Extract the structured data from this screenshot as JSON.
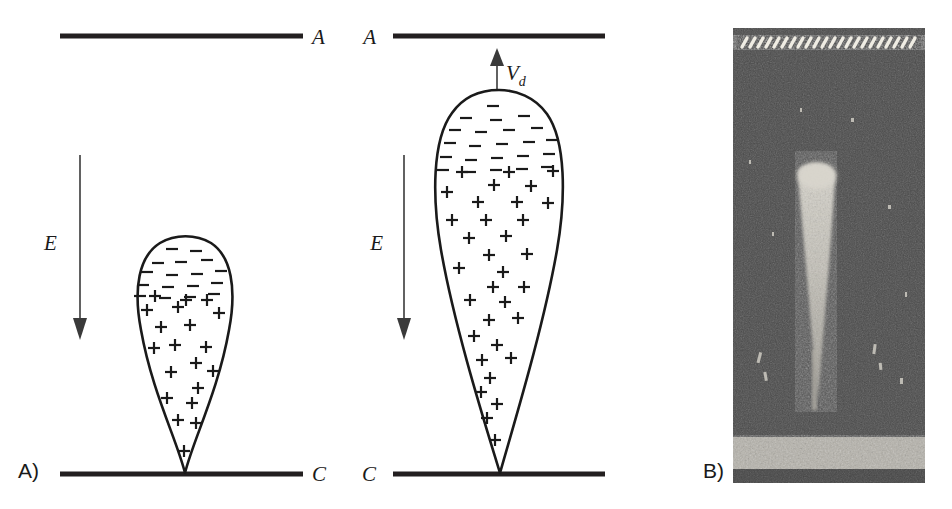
{
  "figure": {
    "background_color": "#ffffff",
    "ink_color": "#1a1a1a",
    "width": 952,
    "height": 509
  },
  "panels": [
    {
      "id": "panel-a",
      "tag": "A)",
      "tag_x": 18,
      "tag_y": 478,
      "description": "Schematic of a small charged droplet on the cathode between two plane electrodes",
      "anode": {
        "label": "A",
        "label_x": 312,
        "label_y": 44,
        "label_side": "right",
        "x1": 60,
        "x2": 303,
        "y": 36
      },
      "cathode": {
        "label": "C",
        "label_x": 312,
        "label_y": 481,
        "label_side": "right",
        "x1": 60,
        "x2": 303,
        "y": 474
      },
      "field_arrow": {
        "label": "E",
        "label_x": 44,
        "label_y": 250,
        "x": 80,
        "y_start": 155,
        "y_end": 338,
        "direction": "down"
      },
      "drop": {
        "apex_x": 185,
        "apex_y": 473,
        "top_y": 238,
        "left_x": 137,
        "right_x": 233,
        "bulge_y": 285,
        "height": 235,
        "max_width": 96
      }
    },
    {
      "id": "panel-b-schematic",
      "tag": "",
      "description": "Schematic of an elongated Taylor cone jet with drift velocity at the tip",
      "anode": {
        "label": "A",
        "label_x": 376,
        "label_y": 44,
        "label_side": "left",
        "x1": 393,
        "x2": 605,
        "y": 36
      },
      "cathode": {
        "label": "C",
        "label_x": 376,
        "label_y": 481,
        "label_side": "left",
        "x1": 393,
        "x2": 605,
        "y": 474
      },
      "field_arrow": {
        "label": "E",
        "label_x": 383,
        "label_y": 250,
        "x": 404,
        "y_start": 155,
        "y_end": 338,
        "direction": "down"
      },
      "velocity_arrow": {
        "label": "V",
        "label_sub": "d",
        "label_x": 508,
        "label_y": 78,
        "x": 497,
        "y_start": 90,
        "y_end": 52,
        "direction": "up"
      },
      "drop": {
        "apex_x": 500,
        "apex_y": 473,
        "top_y": 90,
        "left_x": 437,
        "right_x": 562,
        "bulge_y": 170,
        "height": 383,
        "max_width": 125
      }
    },
    {
      "id": "panel-b-photo",
      "tag": "B)",
      "tag_x": 703,
      "tag_y": 478,
      "description": "Grayscale photograph of a luminous electrospray jet emerging from a grid electrode toward a bright cathode band",
      "photo": {
        "x": 733,
        "y": 28,
        "width": 192,
        "height": 455,
        "background_gray": "#4a4a4a",
        "grid_band": {
          "label": "speckled bright wire grid at top",
          "y": 36,
          "height": 14,
          "color": "#d8d6cf"
        },
        "bottom_band": {
          "label": "bright granular cathode band",
          "y": 435,
          "height": 36,
          "color": "#b9b6ae"
        },
        "jet": {
          "label": "luminous tapering plume",
          "top_y": 168,
          "bottom_y": 400,
          "top_x": 815,
          "top_width": 38,
          "bottom_width": 7,
          "color": "#c9c6bd"
        }
      }
    }
  ],
  "charges": {
    "minus_symbol": "−",
    "plus_symbol": "+",
    "panel_a_minus": [
      [
        172,
        249
      ],
      [
        196,
        251
      ],
      [
        158,
        263
      ],
      [
        181,
        262
      ],
      [
        207,
        260
      ],
      [
        147,
        272
      ],
      [
        172,
        275
      ],
      [
        197,
        274
      ],
      [
        221,
        271
      ],
      [
        143,
        285
      ],
      [
        168,
        287
      ],
      [
        193,
        286
      ],
      [
        217,
        283
      ],
      [
        140,
        296
      ],
      [
        165,
        298
      ],
      [
        190,
        297
      ],
      [
        214,
        294
      ]
    ],
    "panel_a_plus": [
      [
        155,
        296
      ],
      [
        186,
        300
      ],
      [
        207,
        300
      ],
      [
        147,
        310
      ],
      [
        178,
        307
      ],
      [
        219,
        313
      ],
      [
        161,
        327
      ],
      [
        190,
        325
      ],
      [
        154,
        348
      ],
      [
        175,
        345
      ],
      [
        206,
        347
      ],
      [
        196,
        363
      ],
      [
        171,
        372
      ],
      [
        213,
        371
      ],
      [
        198,
        388
      ],
      [
        167,
        398
      ],
      [
        192,
        403
      ],
      [
        178,
        420
      ],
      [
        196,
        423
      ],
      [
        184,
        451
      ]
    ],
    "panel_b_minus": [
      [
        493,
        106
      ],
      [
        466,
        118
      ],
      [
        496,
        120
      ],
      [
        524,
        116
      ],
      [
        455,
        130
      ],
      [
        481,
        132
      ],
      [
        509,
        130
      ],
      [
        537,
        128
      ],
      [
        450,
        143
      ],
      [
        475,
        146
      ],
      [
        502,
        144
      ],
      [
        529,
        142
      ],
      [
        552,
        140
      ],
      [
        446,
        157
      ],
      [
        471,
        160
      ],
      [
        497,
        158
      ],
      [
        523,
        156
      ],
      [
        549,
        154
      ],
      [
        443,
        170
      ],
      [
        470,
        172
      ],
      [
        496,
        170
      ],
      [
        522,
        169
      ],
      [
        547,
        167
      ]
    ],
    "panel_b_plus": [
      [
        462,
        172
      ],
      [
        509,
        172
      ],
      [
        553,
        171
      ],
      [
        494,
        185
      ],
      [
        531,
        186
      ],
      [
        447,
        192
      ],
      [
        478,
        202
      ],
      [
        517,
        202
      ],
      [
        548,
        203
      ],
      [
        452,
        220
      ],
      [
        486,
        220
      ],
      [
        523,
        220
      ],
      [
        469,
        238
      ],
      [
        506,
        236
      ],
      [
        489,
        255
      ],
      [
        527,
        254
      ],
      [
        459,
        268
      ],
      [
        503,
        272
      ],
      [
        493,
        287
      ],
      [
        524,
        287
      ],
      [
        470,
        300
      ],
      [
        505,
        302
      ],
      [
        489,
        320
      ],
      [
        518,
        318
      ],
      [
        474,
        336
      ],
      [
        497,
        345
      ],
      [
        482,
        360
      ],
      [
        511,
        358
      ],
      [
        490,
        378
      ],
      [
        481,
        392
      ],
      [
        497,
        404
      ],
      [
        487,
        418
      ],
      [
        495,
        440
      ]
    ]
  }
}
